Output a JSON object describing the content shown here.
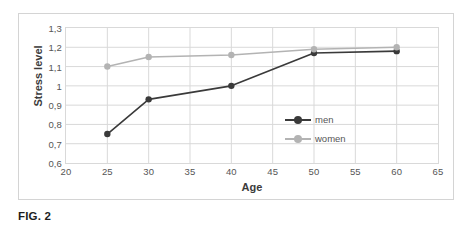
{
  "caption": "FIG. 2",
  "chart_data": {
    "type": "line",
    "title": "",
    "xlabel": "Age",
    "ylabel": "Stress level",
    "x": [
      25,
      30,
      40,
      50,
      60
    ],
    "xlim": [
      20,
      65
    ],
    "ylim": [
      0.6,
      1.3
    ],
    "xticks": [
      20,
      25,
      30,
      35,
      40,
      45,
      50,
      55,
      60,
      65
    ],
    "xtick_labels": [
      "20",
      "25",
      "30",
      "35",
      "40",
      "45",
      "50",
      "55",
      "60",
      "65"
    ],
    "yticks": [
      0.6,
      0.7,
      0.8,
      0.9,
      1.0,
      1.1,
      1.2,
      1.3
    ],
    "ytick_labels": [
      "0,6",
      "0,7",
      "0,8",
      "0,9",
      "1",
      "1,1",
      "1,2",
      "1,3"
    ],
    "grid": true,
    "legend_position": "center-right-inside",
    "series": [
      {
        "name": "men",
        "values": [
          0.75,
          0.93,
          1.0,
          1.17,
          1.18
        ],
        "color": "#3a3a3a"
      },
      {
        "name": "women",
        "values": [
          1.1,
          1.15,
          1.16,
          1.19,
          1.2
        ],
        "color": "#b3b3b3"
      }
    ]
  }
}
